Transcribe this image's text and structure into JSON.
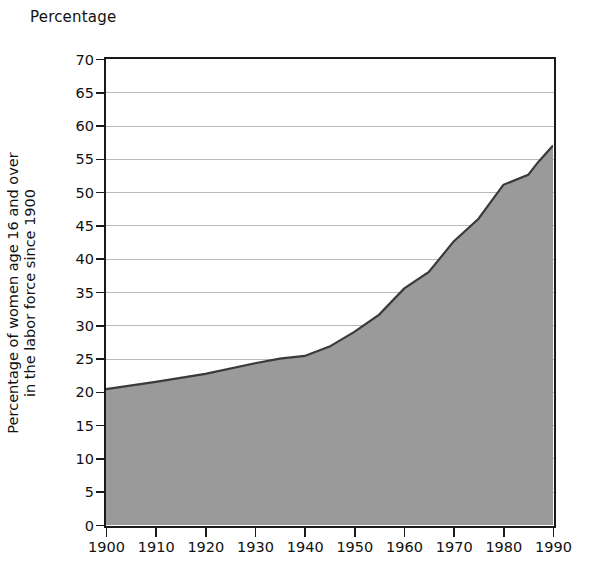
{
  "figure": {
    "top_caption": "Percentage",
    "y_axis_title_line1": "Percentage of women age 16 and over",
    "y_axis_title_line2": "in the labor force since 1900",
    "fill_color": "#9a9a9a",
    "line_color": "#3a3a3a",
    "axis_color": "#1a1a1a",
    "grid_color": "#b9b9b9",
    "background_color": "#ffffff"
  },
  "chart_data": {
    "type": "area",
    "title": "Percentage",
    "xlabel": "",
    "ylabel": "Percentage of women age 16 and over in the labor force since 1900",
    "xlim": [
      1900,
      1990
    ],
    "ylim": [
      0,
      70
    ],
    "ytick_step": 5,
    "xtick_step": 10,
    "grid": true,
    "legend": "none",
    "x_tick_labels": [
      "1900",
      "1910",
      "1920",
      "1930",
      "1940",
      "1950",
      "1960",
      "1970",
      "1980",
      "1990"
    ],
    "y_tick_labels": [
      "0",
      "5",
      "10",
      "15",
      "20",
      "25",
      "30",
      "35",
      "40",
      "45",
      "50",
      "55",
      "60",
      "65",
      "70"
    ],
    "x": [
      1900,
      1910,
      1920,
      1930,
      1935,
      1940,
      1945,
      1950,
      1955,
      1960,
      1965,
      1970,
      1975,
      1980,
      1985,
      1987,
      1990
    ],
    "values": [
      20.4,
      21.5,
      22.7,
      24.3,
      25.0,
      25.4,
      26.8,
      29.0,
      31.6,
      35.5,
      38.0,
      42.6,
      46.0,
      51.1,
      52.6,
      54.5,
      57.0
    ],
    "series": [
      {
        "name": "Percentage of women age 16 and over in the labor force",
        "values": [
          20.4,
          21.5,
          22.7,
          24.3,
          25.0,
          25.4,
          26.8,
          29.0,
          31.6,
          35.5,
          38.0,
          42.6,
          46.0,
          51.1,
          52.6,
          54.5,
          57.0
        ]
      }
    ]
  }
}
